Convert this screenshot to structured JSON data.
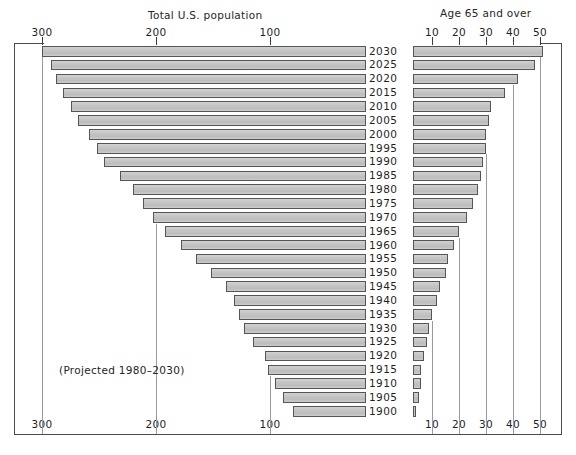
{
  "chart_data": {
    "type": "bar",
    "orientation": "horizontal",
    "style": "bidirectional-pyramid",
    "title": "",
    "left_panel": {
      "title": "Total U.S. population",
      "unit": "millions",
      "axis_ticks": [
        300,
        200,
        100
      ],
      "axis_direction": "right-to-left",
      "axis_min": 0,
      "axis_max": 300
    },
    "right_panel": {
      "title": "Age 65 and over",
      "unit": "millions",
      "axis_ticks": [
        10,
        20,
        30,
        40,
        50
      ],
      "axis_direction": "left-to-right",
      "axis_min": 0,
      "axis_max": 50
    },
    "categories": [
      "2030",
      "2025",
      "2020",
      "2015",
      "2010",
      "2005",
      "2000",
      "1995",
      "1990",
      "1985",
      "1980",
      "1975",
      "1970",
      "1965",
      "1960",
      "1955",
      "1950",
      "1945",
      "1940",
      "1935",
      "1930",
      "1925",
      "1920",
      "1915",
      "1910",
      "1905",
      "1900"
    ],
    "series": [
      {
        "name": "Total U.S. population",
        "panel": "left",
        "values": [
          300,
          292,
          288,
          282,
          275,
          268,
          259,
          252,
          246,
          232,
          220,
          211,
          203,
          192,
          178,
          165,
          152,
          139,
          132,
          127,
          123,
          115,
          104,
          102,
          96,
          89,
          80
        ]
      },
      {
        "name": "Age 65 and over",
        "panel": "right",
        "values": [
          51,
          48,
          42,
          37,
          32,
          31,
          30,
          30,
          29,
          28,
          27,
          25,
          23,
          20,
          18,
          16,
          15,
          13,
          12,
          10,
          9,
          8,
          7,
          6,
          6,
          5,
          4
        ]
      }
    ],
    "annotation": "(Projected 1980–2030)",
    "colors": {
      "bar_fill": "#c6c6c6",
      "bar_stroke": "#555555",
      "axis": "#4a4a4a",
      "text": "#1f1f1f",
      "background": "#ffffff"
    },
    "grid": false,
    "legend": "none"
  },
  "titles": {
    "left": "Total U.S. population",
    "right": "Age 65 and over"
  },
  "axis_top": {
    "left_labels": [
      "300",
      "200",
      "100"
    ],
    "right_labels": [
      "10",
      "20",
      "30",
      "40",
      "50"
    ]
  },
  "axis_bottom": {
    "left_labels": [
      "300",
      "200",
      "100"
    ],
    "right_labels": [
      "10",
      "20",
      "30",
      "40",
      "50"
    ]
  },
  "note": "(Projected 1980–2030)"
}
